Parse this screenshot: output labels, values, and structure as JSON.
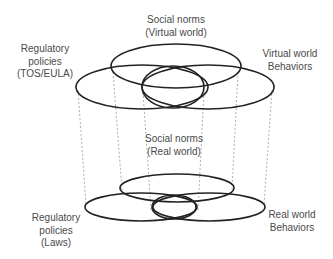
{
  "labels": {
    "social_virtual": {
      "line1": "Social norms",
      "line2": "(Virtual world)"
    },
    "regulatory_virtual": {
      "line1": "Regulatory",
      "line2": "policies",
      "line3": "(TOS/EULA)"
    },
    "behaviors_virtual": {
      "line1": "Virtual world",
      "line2": "Behaviors"
    },
    "social_real": {
      "line1": "Social norms",
      "line2": "(Real world)"
    },
    "regulatory_real": {
      "line1": "Regulatory",
      "line2": "policies",
      "line3": "(Laws)"
    },
    "behaviors_real": {
      "line1": "Real world",
      "line2": "Behaviors"
    }
  },
  "colors": {
    "stroke": "#222222",
    "dash": "#888888",
    "text": "#4a4a4a"
  }
}
